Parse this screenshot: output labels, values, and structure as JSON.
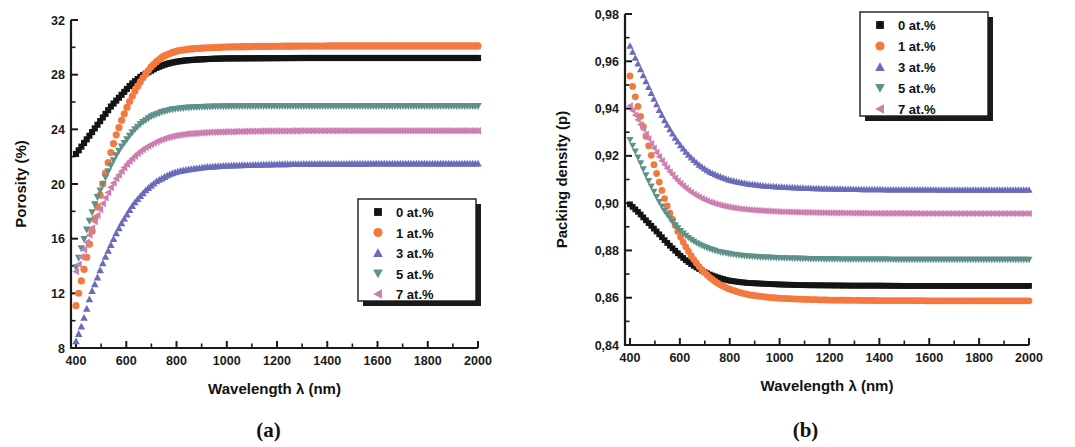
{
  "figure": {
    "panels": [
      {
        "caption": "(a)"
      },
      {
        "caption": "(b)"
      }
    ]
  },
  "chart_data": [
    {
      "type": "scatter",
      "panel": "(a)",
      "title": "",
      "xlabel": "Wavelength λ (nm)",
      "ylabel": "Porosity (%)",
      "xlim": [
        380,
        2000
      ],
      "ylim": [
        8,
        32
      ],
      "xticks": [
        400,
        600,
        800,
        1000,
        1200,
        1400,
        1600,
        1800,
        2000
      ],
      "xtick_labels": [
        "400",
        "600",
        "800",
        "1000",
        "1200",
        "1400",
        "1600",
        "1800",
        "2000"
      ],
      "yticks": [
        8,
        12,
        16,
        20,
        24,
        28,
        32
      ],
      "ytick_labels": [
        "8",
        "12",
        "16",
        "20",
        "24",
        "28",
        "32"
      ],
      "minor_ticks": true,
      "grid": false,
      "legend_position": "lower-right",
      "x": [
        400,
        420,
        440,
        460,
        480,
        500,
        520,
        540,
        560,
        580,
        600,
        620,
        640,
        660,
        680,
        700,
        720,
        740,
        760,
        780,
        800,
        840,
        880,
        920,
        960,
        1000,
        1100,
        1200,
        1300,
        1400,
        1500,
        1600,
        1700,
        1800,
        1900,
        2000
      ],
      "series": [
        {
          "name": "0 at.%",
          "label": "0 at.%",
          "color": "#141414",
          "marker": "square",
          "values": [
            22.2,
            22.7,
            23.2,
            23.7,
            24.2,
            24.7,
            25.2,
            25.7,
            26.1,
            26.5,
            26.9,
            27.3,
            27.6,
            27.9,
            28.1,
            28.3,
            28.5,
            28.65,
            28.78,
            28.87,
            28.95,
            29.05,
            29.1,
            29.14,
            29.17,
            29.19,
            29.2,
            29.21,
            29.22,
            29.22,
            29.22,
            29.22,
            29.22,
            29.22,
            29.22,
            29.22
          ]
        },
        {
          "name": "1 at.%",
          "label": "1 at.%",
          "color": "#f4793e",
          "marker": "circle",
          "values": [
            11.1,
            12.8,
            14.4,
            16.2,
            17.9,
            19.5,
            21.0,
            22.4,
            23.6,
            24.6,
            25.5,
            26.3,
            27.0,
            27.6,
            28.1,
            28.6,
            28.95,
            29.25,
            29.45,
            29.6,
            29.72,
            29.85,
            29.92,
            29.96,
            29.99,
            30.02,
            30.06,
            30.08,
            30.09,
            30.1,
            30.1,
            30.1,
            30.1,
            30.1,
            30.1,
            30.1
          ]
        },
        {
          "name": "3 at.%",
          "label": "3 at.%",
          "color": "#6b6bbb",
          "marker": "triangle-up",
          "values": [
            8.5,
            9.5,
            10.7,
            12.0,
            12.9,
            13.9,
            14.8,
            15.6,
            16.4,
            17.1,
            17.7,
            18.3,
            18.8,
            19.2,
            19.6,
            19.9,
            20.2,
            20.4,
            20.6,
            20.77,
            20.9,
            21.05,
            21.15,
            21.25,
            21.3,
            21.35,
            21.4,
            21.45,
            21.47,
            21.48,
            21.49,
            21.5,
            21.5,
            21.5,
            21.5,
            21.5
          ]
        },
        {
          "name": "5 at.%",
          "label": "5 at.%",
          "color": "#5d9189",
          "marker": "triangle-down",
          "values": [
            13.9,
            15.2,
            16.5,
            17.7,
            18.8,
            19.7,
            20.6,
            21.4,
            22.1,
            22.7,
            23.2,
            23.7,
            24.1,
            24.45,
            24.7,
            24.95,
            25.1,
            25.25,
            25.35,
            25.45,
            25.5,
            25.58,
            25.62,
            25.65,
            25.67,
            25.68,
            25.7,
            25.7,
            25.7,
            25.7,
            25.7,
            25.7,
            25.7,
            25.7,
            25.7,
            25.7
          ]
        },
        {
          "name": "7 at.%",
          "label": "7 at.%",
          "color": "#cd7fb0",
          "marker": "triangle-left",
          "values": [
            13.6,
            14.6,
            15.6,
            16.6,
            17.5,
            18.3,
            19.1,
            19.8,
            20.4,
            20.9,
            21.4,
            21.8,
            22.15,
            22.45,
            22.7,
            22.9,
            23.1,
            23.25,
            23.38,
            23.48,
            23.56,
            23.66,
            23.72,
            23.77,
            23.8,
            23.82,
            23.86,
            23.88,
            23.89,
            23.9,
            23.9,
            23.9,
            23.9,
            23.9,
            23.9,
            23.9
          ]
        }
      ]
    },
    {
      "type": "scatter",
      "panel": "(b)",
      "title": "",
      "xlabel": "Wavelength λ (nm)",
      "ylabel": "Packing density (p)",
      "xlim": [
        380,
        2000
      ],
      "ylim": [
        0.84,
        0.98
      ],
      "xticks": [
        400,
        600,
        800,
        1000,
        1200,
        1400,
        1600,
        1800,
        2000
      ],
      "xtick_labels": [
        "400",
        "600",
        "800",
        "1000",
        "1200",
        "1400",
        "1600",
        "1800",
        "2000"
      ],
      "yticks": [
        0.84,
        0.86,
        0.88,
        0.9,
        0.92,
        0.94,
        0.96,
        0.98
      ],
      "ytick_labels": [
        "0,84",
        "0,86",
        "0,88",
        "0,90",
        "0,92",
        "0,94",
        "0,96",
        "0,98"
      ],
      "minor_ticks": true,
      "grid": false,
      "legend_position": "upper-right",
      "x": [
        400,
        420,
        440,
        460,
        480,
        500,
        520,
        540,
        560,
        580,
        600,
        620,
        640,
        660,
        680,
        700,
        720,
        740,
        760,
        780,
        800,
        840,
        880,
        920,
        960,
        1000,
        1100,
        1200,
        1300,
        1400,
        1500,
        1600,
        1700,
        1800,
        1900,
        2000
      ],
      "series": [
        {
          "name": "0 at.%",
          "label": "0 at.%",
          "color": "#141414",
          "marker": "square",
          "values": [
            0.8995,
            0.8975,
            0.8955,
            0.8932,
            0.891,
            0.8888,
            0.8865,
            0.8842,
            0.882,
            0.88,
            0.878,
            0.8762,
            0.8746,
            0.8732,
            0.872,
            0.8708,
            0.8698,
            0.869,
            0.8683,
            0.8677,
            0.8672,
            0.8666,
            0.8662,
            0.866,
            0.8658,
            0.8656,
            0.8653,
            0.8652,
            0.8651,
            0.8651,
            0.865,
            0.865,
            0.865,
            0.865,
            0.865,
            0.865
          ]
        },
        {
          "name": "1 at.%",
          "label": "1 at.%",
          "color": "#f4793e",
          "marker": "circle",
          "values": [
            0.9538,
            0.9455,
            0.9378,
            0.9298,
            0.9222,
            0.9148,
            0.908,
            0.9015,
            0.8958,
            0.8908,
            0.8862,
            0.8822,
            0.8786,
            0.8755,
            0.8728,
            0.8705,
            0.8686,
            0.867,
            0.8656,
            0.8645,
            0.8636,
            0.8622,
            0.8612,
            0.8606,
            0.8601,
            0.8598,
            0.8593,
            0.859,
            0.8589,
            0.8588,
            0.8588,
            0.8587,
            0.8587,
            0.8587,
            0.8587,
            0.8587
          ]
        },
        {
          "name": "3 at.%",
          "label": "3 at.%",
          "color": "#6b6bbb",
          "marker": "triangle-up",
          "values": [
            0.9665,
            0.9618,
            0.9572,
            0.9525,
            0.9478,
            0.9432,
            0.9388,
            0.9348,
            0.9312,
            0.9278,
            0.9248,
            0.9222,
            0.9198,
            0.9178,
            0.916,
            0.9145,
            0.9132,
            0.9122,
            0.9113,
            0.9105,
            0.9098,
            0.9088,
            0.9081,
            0.9076,
            0.9072,
            0.9069,
            0.9064,
            0.9061,
            0.9059,
            0.9058,
            0.9057,
            0.9057,
            0.9056,
            0.9056,
            0.9056,
            0.9056
          ]
        },
        {
          "name": "5 at.%",
          "label": "5 at.%",
          "color": "#5d9189",
          "marker": "triangle-down",
          "values": [
            0.9268,
            0.9222,
            0.9175,
            0.9128,
            0.9082,
            0.904,
            0.9,
            0.8965,
            0.8935,
            0.8908,
            0.8885,
            0.8866,
            0.8849,
            0.8835,
            0.8824,
            0.8814,
            0.8806,
            0.8799,
            0.8793,
            0.8789,
            0.8785,
            0.8779,
            0.8775,
            0.8772,
            0.877,
            0.8768,
            0.8765,
            0.8763,
            0.8762,
            0.8762,
            0.8761,
            0.8761,
            0.8761,
            0.8761,
            0.8761,
            0.8761
          ]
        },
        {
          "name": "7 at.%",
          "label": "7 at.%",
          "color": "#cd7fb0",
          "marker": "triangle-left",
          "values": [
            0.9412,
            0.9375,
            0.9338,
            0.93,
            0.9262,
            0.9226,
            0.9192,
            0.9161,
            0.9133,
            0.9108,
            0.9086,
            0.9067,
            0.905,
            0.9036,
            0.9024,
            0.9014,
            0.9005,
            0.8998,
            0.8992,
            0.8987,
            0.8983,
            0.8976,
            0.8972,
            0.8969,
            0.8966,
            0.8964,
            0.8961,
            0.8959,
            0.8958,
            0.8957,
            0.8957,
            0.8956,
            0.8956,
            0.8956,
            0.8956,
            0.8956
          ]
        }
      ]
    }
  ]
}
